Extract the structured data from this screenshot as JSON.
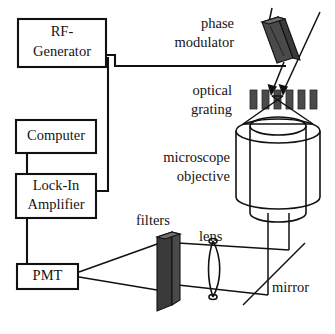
{
  "figure": {
    "type": "optical-setup-schematic",
    "background_color": "#ffffff",
    "line_color": "#111111"
  },
  "instrument_boxes": [
    {
      "id": "rf-generator",
      "line1": "RF-",
      "line2": "Generator",
      "x": 18,
      "y": 19,
      "w": 88,
      "h": 48
    },
    {
      "id": "computer",
      "line1": "Computer",
      "line2": "",
      "x": 16,
      "y": 120,
      "w": 80,
      "h": 33
    },
    {
      "id": "lock-in-amplifier",
      "line1": "Lock-In",
      "line2": "Amplifier",
      "x": 16,
      "y": 174,
      "w": 80,
      "h": 44
    },
    {
      "id": "pmt",
      "line1": "PMT",
      "line2": "",
      "x": 17,
      "y": 264,
      "w": 61,
      "h": 25
    }
  ],
  "component_labels": [
    {
      "id": "phase-modulator",
      "line1": "phase",
      "line2": "modulator",
      "x": 234,
      "y": 24,
      "align": "end"
    },
    {
      "id": "optical-grating",
      "line1": "optical",
      "line2": "grating",
      "x": 232,
      "y": 92,
      "align": "end"
    },
    {
      "id": "microscope-objective",
      "line1": "microscope",
      "line2": "objective",
      "x": 230,
      "y": 158,
      "align": "end"
    },
    {
      "id": "filters",
      "line1": "filters",
      "line2": "",
      "x": 163,
      "y": 222,
      "align": "start"
    },
    {
      "id": "lens",
      "line1": "lens",
      "line2": "",
      "x": 207,
      "y": 238,
      "align": "start"
    },
    {
      "id": "mirror",
      "line1": "mirror",
      "line2": "",
      "x": 272,
      "y": 288,
      "align": "start"
    }
  ],
  "optics": {
    "grating_bar_count": 6,
    "grating_y": 90,
    "grating_bar_height": 19,
    "grating_bar_width": 7,
    "grating_bars_x": [
      250,
      262,
      274,
      286,
      298,
      310
    ],
    "objective_center_x": 278,
    "objective_top_y": 118,
    "objective_bottom_y": 213,
    "filters_color": "#3a3a3a",
    "phase_modulator_color": "#4a4a4a"
  },
  "connections": [
    {
      "id": "rf-to-modulator",
      "from": "rf-generator",
      "to": "phase-modulator"
    },
    {
      "id": "rf-to-lockin",
      "from": "rf-generator",
      "to": "lock-in-amplifier"
    },
    {
      "id": "computer-to-lockin",
      "from": "computer",
      "to": "lock-in-amplifier"
    },
    {
      "id": "lockin-to-pmt",
      "from": "lock-in-amplifier",
      "to": "pmt"
    },
    {
      "id": "pmt-collection",
      "from": "filters",
      "to": "pmt"
    }
  ]
}
